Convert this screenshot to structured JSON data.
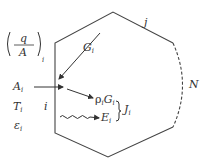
{
  "diagram": {
    "colors": {
      "stroke": "#444444",
      "text": "#333333",
      "background": "#ffffff"
    },
    "enclosure": {
      "surfaces": [
        "i",
        "j",
        "N"
      ],
      "vertices": [
        [
          55,
          43
        ],
        [
          113,
          12
        ],
        [
          173,
          43
        ],
        [
          173,
          127
        ],
        [
          108,
          157
        ],
        [
          55,
          133
        ]
      ],
      "dashed_segment": "N"
    },
    "labels": {
      "heat_flux": {
        "numerator": "q",
        "denominator": "A",
        "subscript": "i"
      },
      "area": {
        "symbol": "A",
        "subscript": "i"
      },
      "temperature": {
        "symbol": "T",
        "subscript": "i"
      },
      "emissivity": {
        "symbol": "ε",
        "subscript": "i"
      },
      "surface_i": "i",
      "surface_j": "j",
      "surface_N": "N",
      "irradiation": {
        "symbol": "G",
        "subscript": "i"
      },
      "reflected": {
        "prefix": "ρ",
        "prefix_sub": "i",
        "symbol": "G",
        "subscript": "i"
      },
      "emitted": {
        "symbol": "E",
        "subscript": "i"
      },
      "radiosity": {
        "symbol": "J",
        "subscript": "i"
      }
    }
  }
}
